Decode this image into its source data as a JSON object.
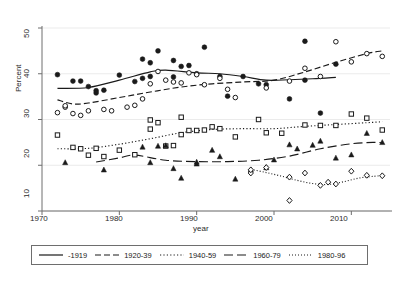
{
  "chart_data": {
    "type": "scatter",
    "title": "",
    "subtitle": "",
    "xlabel": "year",
    "ylabel": "Percent",
    "xlim": [
      1970,
      2015
    ],
    "ylim": [
      10,
      50
    ],
    "xticks": [
      1970,
      1980,
      1990,
      2000,
      2010
    ],
    "yticks": [
      10,
      20,
      30,
      40,
      50
    ],
    "grid": true,
    "grid_axis": "y",
    "legend_position": "bottom",
    "legend_entries": [
      "-1919",
      "1920-39",
      "1940-59",
      "1960-79",
      "1980-96"
    ],
    "series": [
      {
        "name": "-1919",
        "marker": "filled-circle",
        "line_style": "solid",
        "points": [
          {
            "x": 1972,
            "y": 39.8
          },
          {
            "x": 1974,
            "y": 38.4
          },
          {
            "x": 1975,
            "y": 38.4
          },
          {
            "x": 1976,
            "y": 37.2
          },
          {
            "x": 1977,
            "y": 35.8
          },
          {
            "x": 1977,
            "y": 36.3
          },
          {
            "x": 1978,
            "y": 36.4
          },
          {
            "x": 1980,
            "y": 39.7
          },
          {
            "x": 1982,
            "y": 38.3
          },
          {
            "x": 1983,
            "y": 43.2
          },
          {
            "x": 1983,
            "y": 39.0
          },
          {
            "x": 1984,
            "y": 42.4
          },
          {
            "x": 1984,
            "y": 39.4
          },
          {
            "x": 1985,
            "y": 45.0
          },
          {
            "x": 1987,
            "y": 42.9
          },
          {
            "x": 1987,
            "y": 39.3
          },
          {
            "x": 1988,
            "y": 41.6
          },
          {
            "x": 1989,
            "y": 41.8
          },
          {
            "x": 1990,
            "y": 40.0
          },
          {
            "x": 1991,
            "y": 45.8
          },
          {
            "x": 1993,
            "y": 39.4
          },
          {
            "x": 1994,
            "y": 35.1
          },
          {
            "x": 1996,
            "y": 39.4
          },
          {
            "x": 1998,
            "y": 37.8
          },
          {
            "x": 1999,
            "y": 37.6
          },
          {
            "x": 2002,
            "y": 34.5
          },
          {
            "x": 2004,
            "y": 47.1
          },
          {
            "x": 2004,
            "y": 38.6
          },
          {
            "x": 2006,
            "y": 31.4
          },
          {
            "x": 2008,
            "y": 42.1
          }
        ],
        "fit": [
          {
            "x": 1972,
            "y": 36.8
          },
          {
            "x": 1976,
            "y": 37.0
          },
          {
            "x": 1980,
            "y": 38.6
          },
          {
            "x": 1984,
            "y": 40.4
          },
          {
            "x": 1986,
            "y": 40.8
          },
          {
            "x": 1990,
            "y": 40.2
          },
          {
            "x": 1993,
            "y": 40.0
          },
          {
            "x": 1996,
            "y": 39.4
          },
          {
            "x": 1999,
            "y": 38.6
          },
          {
            "x": 2002,
            "y": 38.7
          },
          {
            "x": 2005,
            "y": 38.9
          },
          {
            "x": 2008,
            "y": 39.2
          }
        ]
      },
      {
        "name": "1920-39",
        "marker": "open-circle",
        "line_style": "dashed",
        "points": [
          {
            "x": 1972,
            "y": 31.5
          },
          {
            "x": 1973,
            "y": 32.7
          },
          {
            "x": 1973,
            "y": 33.0
          },
          {
            "x": 1974,
            "y": 31.3
          },
          {
            "x": 1975,
            "y": 30.9
          },
          {
            "x": 1976,
            "y": 31.9
          },
          {
            "x": 1978,
            "y": 32.2
          },
          {
            "x": 1979,
            "y": 31.9
          },
          {
            "x": 1981,
            "y": 32.7
          },
          {
            "x": 1982,
            "y": 33.1
          },
          {
            "x": 1983,
            "y": 34.5
          },
          {
            "x": 1984,
            "y": 37.8
          },
          {
            "x": 1985,
            "y": 40.5
          },
          {
            "x": 1986,
            "y": 38.6
          },
          {
            "x": 1987,
            "y": 38.2
          },
          {
            "x": 1988,
            "y": 38.0
          },
          {
            "x": 1989,
            "y": 40.2
          },
          {
            "x": 1990,
            "y": 39.8
          },
          {
            "x": 1991,
            "y": 37.6
          },
          {
            "x": 1993,
            "y": 39.0
          },
          {
            "x": 1994,
            "y": 36.6
          },
          {
            "x": 1995,
            "y": 34.8
          },
          {
            "x": 1999,
            "y": 36.9
          },
          {
            "x": 2002,
            "y": 38.4
          },
          {
            "x": 2004,
            "y": 41.2
          },
          {
            "x": 2006,
            "y": 39.4
          },
          {
            "x": 2008,
            "y": 47.0
          },
          {
            "x": 2010,
            "y": 42.6
          },
          {
            "x": 2012,
            "y": 44.4
          },
          {
            "x": 2014,
            "y": 43.8
          }
        ],
        "fit": [
          {
            "x": 1972,
            "y": 34.3
          },
          {
            "x": 1974,
            "y": 33.4
          },
          {
            "x": 1976,
            "y": 33.6
          },
          {
            "x": 1980,
            "y": 34.8
          },
          {
            "x": 1984,
            "y": 36.0
          },
          {
            "x": 1988,
            "y": 37.1
          },
          {
            "x": 1992,
            "y": 37.8
          },
          {
            "x": 1996,
            "y": 38.2
          },
          {
            "x": 2000,
            "y": 38.6
          },
          {
            "x": 2004,
            "y": 40.4
          },
          {
            "x": 2008,
            "y": 42.5
          },
          {
            "x": 2012,
            "y": 44.4
          },
          {
            "x": 2014,
            "y": 45.0
          }
        ]
      },
      {
        "name": "1940-59",
        "marker": "open-square",
        "line_style": "dotted",
        "points": [
          {
            "x": 1972,
            "y": 26.6
          },
          {
            "x": 1974,
            "y": 23.9
          },
          {
            "x": 1975,
            "y": 23.6
          },
          {
            "x": 1976,
            "y": 22.2
          },
          {
            "x": 1977,
            "y": 23.7
          },
          {
            "x": 1978,
            "y": 21.9
          },
          {
            "x": 1980,
            "y": 23.3
          },
          {
            "x": 1982,
            "y": 22.3
          },
          {
            "x": 1984,
            "y": 29.9
          },
          {
            "x": 1984,
            "y": 27.9
          },
          {
            "x": 1985,
            "y": 29.3
          },
          {
            "x": 1986,
            "y": 24.2
          },
          {
            "x": 1987,
            "y": 24.3
          },
          {
            "x": 1988,
            "y": 30.5
          },
          {
            "x": 1988,
            "y": 26.7
          },
          {
            "x": 1989,
            "y": 27.6
          },
          {
            "x": 1990,
            "y": 27.6
          },
          {
            "x": 1991,
            "y": 27.7
          },
          {
            "x": 1992,
            "y": 28.4
          },
          {
            "x": 1993,
            "y": 28.0
          },
          {
            "x": 1995,
            "y": 26.2
          },
          {
            "x": 1998,
            "y": 30.0
          },
          {
            "x": 1999,
            "y": 27.1
          },
          {
            "x": 2001,
            "y": 27.0
          },
          {
            "x": 2004,
            "y": 28.8
          },
          {
            "x": 2006,
            "y": 28.7
          },
          {
            "x": 2008,
            "y": 28.7
          },
          {
            "x": 2010,
            "y": 31.2
          },
          {
            "x": 2012,
            "y": 30.3
          },
          {
            "x": 2014,
            "y": 27.7
          }
        ],
        "fit": [
          {
            "x": 1972,
            "y": 23.6
          },
          {
            "x": 1976,
            "y": 23.7
          },
          {
            "x": 1980,
            "y": 24.6
          },
          {
            "x": 1984,
            "y": 25.8
          },
          {
            "x": 1988,
            "y": 27.1
          },
          {
            "x": 1992,
            "y": 27.8
          },
          {
            "x": 1996,
            "y": 28.0
          },
          {
            "x": 2000,
            "y": 28.0
          },
          {
            "x": 2004,
            "y": 28.5
          },
          {
            "x": 2008,
            "y": 28.9
          },
          {
            "x": 2012,
            "y": 29.3
          },
          {
            "x": 2014,
            "y": 29.5
          }
        ]
      },
      {
        "name": "1960-79",
        "marker": "filled-triangle",
        "line_style": "long-dash",
        "points": [
          {
            "x": 1973,
            "y": 20.6
          },
          {
            "x": 1978,
            "y": 19.0
          },
          {
            "x": 1983,
            "y": 24.0
          },
          {
            "x": 1984,
            "y": 20.6
          },
          {
            "x": 1985,
            "y": 24.2
          },
          {
            "x": 1986,
            "y": 24.3
          },
          {
            "x": 1987,
            "y": 19.3
          },
          {
            "x": 1988,
            "y": 17.2
          },
          {
            "x": 1990,
            "y": 20.7
          },
          {
            "x": 1990,
            "y": 20.3
          },
          {
            "x": 1992,
            "y": 23.3
          },
          {
            "x": 1993,
            "y": 21.9
          },
          {
            "x": 1995,
            "y": 17.0
          },
          {
            "x": 1997,
            "y": 19.0
          },
          {
            "x": 1999,
            "y": 19.5
          },
          {
            "x": 2000,
            "y": 21.2
          },
          {
            "x": 2002,
            "y": 24.5
          },
          {
            "x": 2003,
            "y": 23.6
          },
          {
            "x": 2005,
            "y": 24.4
          },
          {
            "x": 2006,
            "y": 25.3
          },
          {
            "x": 2008,
            "y": 21.6
          },
          {
            "x": 2010,
            "y": 22.3
          },
          {
            "x": 2012,
            "y": 27.0
          },
          {
            "x": 2014,
            "y": 25.0
          }
        ],
        "fit": [
          {
            "x": 1977,
            "y": 20.7
          },
          {
            "x": 1980,
            "y": 21.6
          },
          {
            "x": 1982,
            "y": 22.2
          },
          {
            "x": 1986,
            "y": 21.1
          },
          {
            "x": 1990,
            "y": 20.8
          },
          {
            "x": 1994,
            "y": 20.8
          },
          {
            "x": 1998,
            "y": 21.1
          },
          {
            "x": 2002,
            "y": 22.0
          },
          {
            "x": 2006,
            "y": 23.6
          },
          {
            "x": 2010,
            "y": 24.7
          },
          {
            "x": 2013,
            "y": 25.0
          },
          {
            "x": 2014,
            "y": 24.9
          }
        ]
      },
      {
        "name": "1980-96",
        "marker": "open-diamond",
        "line_style": "fine-dotted",
        "points": [
          {
            "x": 1997,
            "y": 18.3
          },
          {
            "x": 1997,
            "y": 19.0
          },
          {
            "x": 1999,
            "y": 19.5
          },
          {
            "x": 2002,
            "y": 12.3
          },
          {
            "x": 2002,
            "y": 17.4
          },
          {
            "x": 2004,
            "y": 18.3
          },
          {
            "x": 2006,
            "y": 15.6
          },
          {
            "x": 2007,
            "y": 16.3
          },
          {
            "x": 2008,
            "y": 15.9
          },
          {
            "x": 2010,
            "y": 18.7
          },
          {
            "x": 2012,
            "y": 17.8
          },
          {
            "x": 2014,
            "y": 17.7
          }
        ],
        "fit": [
          {
            "x": 1997,
            "y": 19.1
          },
          {
            "x": 1999,
            "y": 18.4
          },
          {
            "x": 2001,
            "y": 17.6
          },
          {
            "x": 2003,
            "y": 16.7
          },
          {
            "x": 2005,
            "y": 16.0
          },
          {
            "x": 2007,
            "y": 15.8
          },
          {
            "x": 2009,
            "y": 16.4
          },
          {
            "x": 2011,
            "y": 17.2
          },
          {
            "x": 2013,
            "y": 17.6
          },
          {
            "x": 2014,
            "y": 17.7
          }
        ]
      }
    ]
  },
  "axes": {
    "ylabel": "Percent",
    "xlabel": "year",
    "yticks": [
      "10",
      "20",
      "30",
      "40",
      "50"
    ],
    "xticks": [
      "1970",
      "1980",
      "1990",
      "2000",
      "2010"
    ]
  },
  "legend": {
    "items": [
      {
        "label": "-1919",
        "style": "solid"
      },
      {
        "label": "1920-39",
        "style": "dashed"
      },
      {
        "label": "1940-59",
        "style": "dotted"
      },
      {
        "label": "1960-79",
        "style": "long-dash"
      },
      {
        "label": "1980-96",
        "style": "fine-dotted"
      }
    ]
  },
  "colors": {
    "line": "#1a1a1a",
    "axis": "#6e6e6e",
    "grid": "#e6e6e6",
    "background": "#ffffff"
  }
}
